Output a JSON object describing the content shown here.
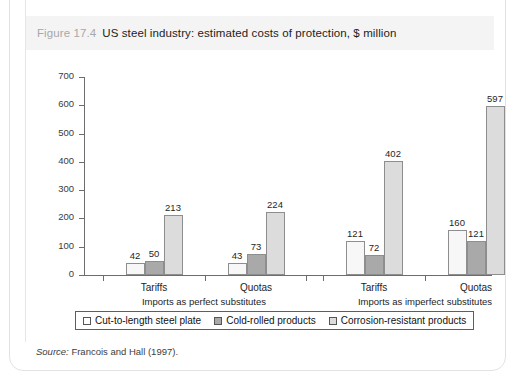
{
  "figure": {
    "number": "Figure 17.4",
    "title": "US steel industry: estimated costs of protection, $ million",
    "source_keyword": "Source:",
    "source_text": "Francois and Hall (1997)."
  },
  "chart_data": {
    "type": "bar",
    "title": "US steel industry: estimated costs of protection, $ million",
    "xlabel": "",
    "ylabel": "",
    "ylim": [
      0,
      700
    ],
    "yticks": [
      0,
      100,
      200,
      300,
      400,
      500,
      600,
      700
    ],
    "grid": false,
    "legend_position": "bottom",
    "categories": [
      "Tariffs",
      "Quotas",
      "Tariffs",
      "Quotas"
    ],
    "groups": [
      {
        "label": "Imports as perfect substitutes",
        "categories": [
          "Tariffs",
          "Quotas"
        ]
      },
      {
        "label": "Imports as imperfect substitutes",
        "categories": [
          "Tariffs",
          "Quotas"
        ]
      }
    ],
    "series": [
      {
        "name": "Cut-to-length steel plate",
        "color": "#f7f7f7",
        "values": [
          42,
          43,
          121,
          160
        ]
      },
      {
        "name": "Cold-rolled products",
        "color": "#a9a9a9",
        "values": [
          50,
          73,
          72,
          121
        ]
      },
      {
        "name": "Corrosion-resistant products",
        "color": "#dcdcdc",
        "values": [
          213,
          224,
          402,
          597
        ]
      }
    ]
  },
  "legend": {
    "items": [
      {
        "label": "Cut-to-length steel plate",
        "swatch": "s0"
      },
      {
        "label": "Cold-rolled products",
        "swatch": "s1"
      },
      {
        "label": "Corrosion-resistant products",
        "swatch": "s2"
      }
    ]
  }
}
